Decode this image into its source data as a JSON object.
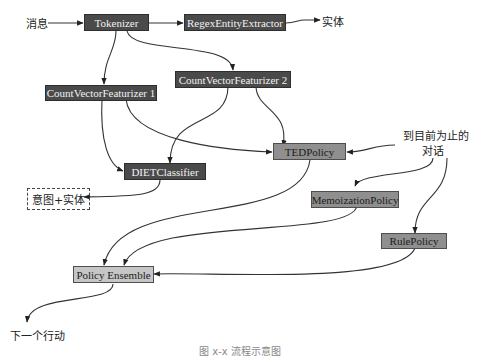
{
  "diagram": {
    "inputs": {
      "message": "消息",
      "conversation": "到目前为止的",
      "conversation_line2": "对话"
    },
    "nodes": {
      "tokenizer": "Tokenizer",
      "regex": "RegexEntityExtractor",
      "cvf1": "CountVectorFeaturizer 1",
      "cvf2": "CountVectorFeaturizer 2",
      "diet": "DIETClassifier",
      "ted": "TEDPolicy",
      "memo": "MemoizationPolicy",
      "rule": "RulePolicy",
      "ensemble": "Policy Ensemble"
    },
    "outputs": {
      "entities": "实体",
      "intent_entities": "意图+实体",
      "next_action": "下一个行动"
    },
    "edges": [
      [
        "消息",
        "Tokenizer"
      ],
      [
        "Tokenizer",
        "RegexEntityExtractor"
      ],
      [
        "RegexEntityExtractor",
        "实体"
      ],
      [
        "Tokenizer",
        "CountVectorFeaturizer 1"
      ],
      [
        "Tokenizer",
        "CountVectorFeaturizer 2"
      ],
      [
        "CountVectorFeaturizer 1",
        "DIETClassifier"
      ],
      [
        "CountVectorFeaturizer 1",
        "TEDPolicy"
      ],
      [
        "CountVectorFeaturizer 2",
        "DIETClassifier"
      ],
      [
        "CountVectorFeaturizer 2",
        "TEDPolicy"
      ],
      [
        "DIETClassifier",
        "意图+实体"
      ],
      [
        "到目前为止的对话",
        "TEDPolicy"
      ],
      [
        "到目前为止的对话",
        "MemoizationPolicy"
      ],
      [
        "到目前为止的对话",
        "RulePolicy"
      ],
      [
        "TEDPolicy",
        "Policy Ensemble"
      ],
      [
        "MemoizationPolicy",
        "Policy Ensemble"
      ],
      [
        "RulePolicy",
        "Policy Ensemble"
      ],
      [
        "Policy Ensemble",
        "下一个行动"
      ]
    ],
    "caption": "图 x-x 流程示意图"
  }
}
